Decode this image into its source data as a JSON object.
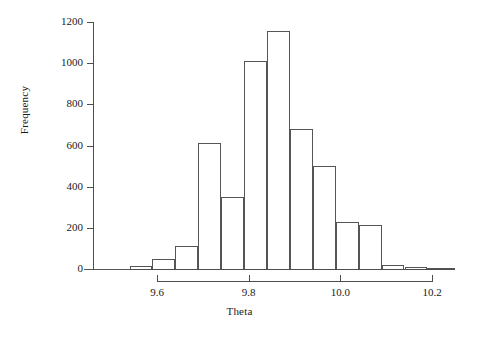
{
  "chart_data": {
    "type": "bar",
    "title": "",
    "subtitle": "",
    "xlabel": "Theta",
    "ylabel": "Frequency",
    "xlim": [
      9.44,
      10.25
    ],
    "ylim": [
      0,
      1200
    ],
    "grid": false,
    "legend": null,
    "bin_width": 0.05,
    "x_tick_labels": [
      "9.6",
      "9.8",
      "10.0",
      "10.2"
    ],
    "x_tick_values": [
      9.6,
      9.8,
      10.0,
      10.2
    ],
    "y_tick_labels": [
      "0",
      "200",
      "400",
      "600",
      "800",
      "1000",
      "1200"
    ],
    "y_tick_values": [
      0,
      200,
      400,
      600,
      800,
      1000,
      1200
    ],
    "bins": [
      {
        "left": 9.44,
        "right": 9.49,
        "value": 0
      },
      {
        "left": 9.49,
        "right": 9.54,
        "value": 0
      },
      {
        "left": 9.54,
        "right": 9.59,
        "value": 15
      },
      {
        "left": 9.59,
        "right": 9.64,
        "value": 48
      },
      {
        "left": 9.64,
        "right": 9.69,
        "value": 110
      },
      {
        "left": 9.69,
        "right": 9.74,
        "value": 612
      },
      {
        "left": 9.74,
        "right": 9.79,
        "value": 348
      },
      {
        "left": 9.79,
        "right": 9.84,
        "value": 1010
      },
      {
        "left": 9.84,
        "right": 9.89,
        "value": 1155
      },
      {
        "left": 9.89,
        "right": 9.94,
        "value": 680
      },
      {
        "left": 9.94,
        "right": 9.99,
        "value": 500
      },
      {
        "left": 9.99,
        "right": 10.04,
        "value": 230
      },
      {
        "left": 10.04,
        "right": 10.09,
        "value": 212
      },
      {
        "left": 10.09,
        "right": 10.14,
        "value": 18
      },
      {
        "left": 10.14,
        "right": 10.19,
        "value": 10
      },
      {
        "left": 10.19,
        "right": 10.25,
        "value": 5
      }
    ],
    "categories": [
      "9.44-9.49",
      "9.49-9.54",
      "9.54-9.59",
      "9.59-9.64",
      "9.64-9.69",
      "9.69-9.74",
      "9.74-9.79",
      "9.79-9.84",
      "9.84-9.89",
      "9.89-9.94",
      "9.94-9.99",
      "9.99-10.04",
      "10.04-10.09",
      "10.09-10.14",
      "10.14-10.19",
      "10.19-10.25"
    ],
    "values": [
      0,
      0,
      15,
      48,
      110,
      612,
      348,
      1010,
      1155,
      680,
      500,
      230,
      212,
      18,
      10,
      5
    ],
    "colors": {
      "bar_stroke": "#555555",
      "bar_fill": "#ffffff",
      "axis": "#4d4d4d",
      "text": "#1a1a1a",
      "background": "#ffffff"
    }
  },
  "axes": {
    "x": {
      "label": "Theta",
      "ticks": [
        {
          "label": "9.6",
          "value": 9.6
        },
        {
          "label": "9.8",
          "value": 9.8
        },
        {
          "label": "10.0",
          "value": 10.0
        },
        {
          "label": "10.2",
          "value": 10.2
        }
      ]
    },
    "y": {
      "label": "Frequency",
      "ticks": [
        {
          "label": "0",
          "value": 0
        },
        {
          "label": "200",
          "value": 200
        },
        {
          "label": "400",
          "value": 400
        },
        {
          "label": "600",
          "value": 600
        },
        {
          "label": "800",
          "value": 800
        },
        {
          "label": "1000",
          "value": 1000
        },
        {
          "label": "1200",
          "value": 1200
        }
      ]
    }
  }
}
